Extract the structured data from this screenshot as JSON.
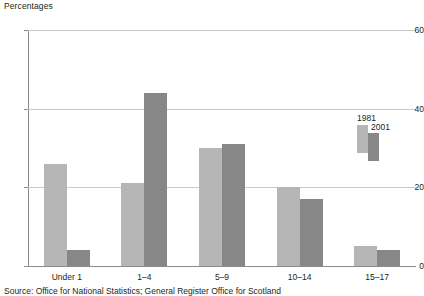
{
  "chart_data": {
    "type": "bar",
    "title": "",
    "subtitle": "",
    "ylabel": "Percentages",
    "xlabel": "",
    "categories": [
      "Under 1",
      "1–4",
      "5–9",
      "10–14",
      "15–17"
    ],
    "series": [
      {
        "name": "1981",
        "color": "#b6b6b6",
        "values": [
          26,
          21,
          30,
          20,
          5
        ]
      },
      {
        "name": "2001",
        "color": "#878787",
        "values": [
          4,
          44,
          31,
          17,
          4
        ]
      }
    ],
    "ylim": [
      0,
      60
    ],
    "yticks": [
      0,
      20,
      40,
      60
    ],
    "ytick_labels": [
      "0",
      "20",
      "40",
      "60"
    ],
    "grid": true,
    "legend_position": "inside-upper-right",
    "legend_entries": [
      "1981",
      "2001"
    ]
  },
  "source": {
    "note": "Source: Office for National Statistics; General Register Office for Scotland"
  }
}
